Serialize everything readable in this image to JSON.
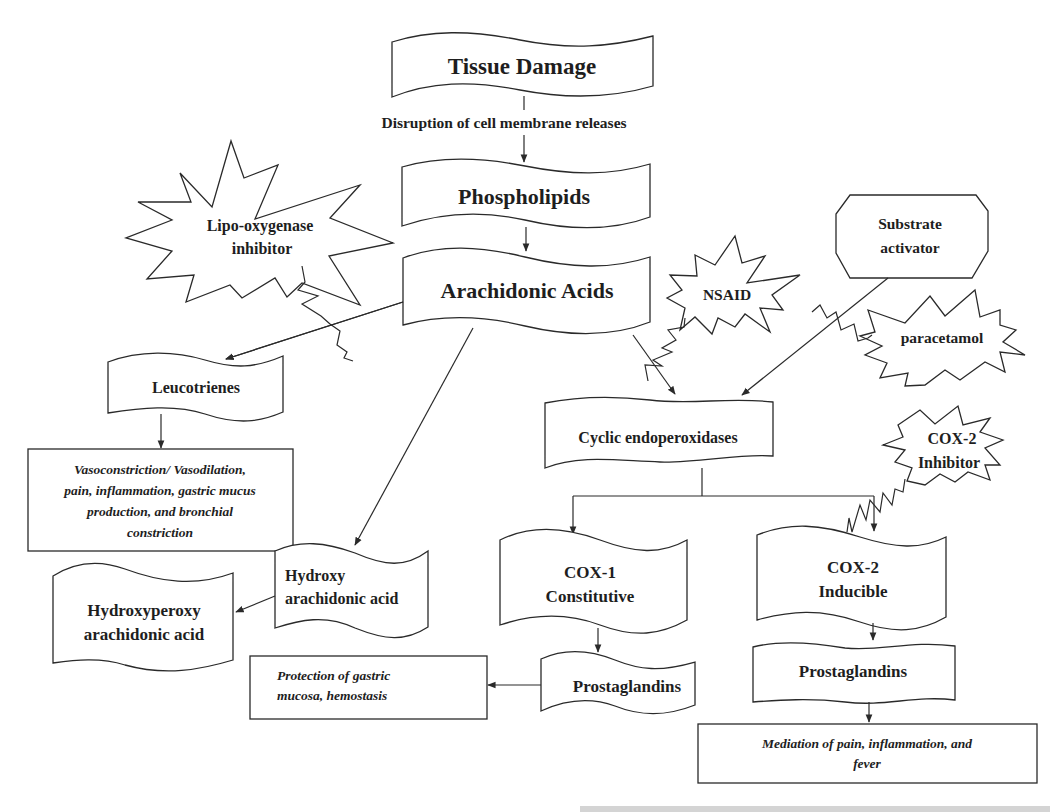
{
  "diagram": {
    "type": "flowchart",
    "topic": "Arachidonic acid pathway and sites of action of inhibitors",
    "nodes": {
      "tissue_damage": {
        "label": "Tissue Damage",
        "shape": "wave-banner"
      },
      "disruption_label": {
        "label": "Disruption of cell membrane releases",
        "shape": "edge-label"
      },
      "phospholipids": {
        "label": "Phospholipids",
        "shape": "wave-banner"
      },
      "arachidonic_acids": {
        "label": "Arachidonic Acids",
        "shape": "wave-banner"
      },
      "lipo_oxygenase_inhibitor": {
        "line1": "Lipo-oxygenase",
        "line2": "inhibitor",
        "shape": "explosion"
      },
      "nsaid": {
        "label": "NSAID",
        "shape": "explosion"
      },
      "substrate_activator": {
        "line1": "Substrate",
        "line2": "activator",
        "shape": "octagon"
      },
      "paracetamol": {
        "label": "paracetamol",
        "shape": "explosion"
      },
      "cox2_inhibitor": {
        "line1": "COX-2",
        "line2": "Inhibitor",
        "shape": "explosion"
      },
      "leucotrienes": {
        "label": "Leucotrienes",
        "shape": "wave-banner"
      },
      "leucotriene_effects": {
        "line1": "Vasoconstriction/ Vasodilation,",
        "line2": "pain, inflammation, gastric mucus",
        "line3": "production, and bronchial",
        "line4": "constriction",
        "shape": "rectangle"
      },
      "cyclic_endoperoxidases": {
        "label": "Cyclic endoperoxidases",
        "shape": "wave-banner"
      },
      "hydroxy_arachidonic_acid": {
        "line1": "Hydroxy",
        "line2": "arachidonic acid",
        "shape": "wave-banner"
      },
      "hydroxyperoxy_arachidonic_acid": {
        "line1": "Hydroxyperoxy",
        "line2": "arachidonic acid",
        "shape": "wave-banner"
      },
      "cox1": {
        "line1": "COX-1",
        "line2": "Constitutive",
        "shape": "wave-banner"
      },
      "cox2": {
        "line1": "COX-2",
        "line2": "Inducible",
        "shape": "wave-banner"
      },
      "prostaglandins_cox1": {
        "label": "Prostaglandins",
        "shape": "wave-banner"
      },
      "prostaglandins_cox2": {
        "label": "Prostaglandins",
        "shape": "wave-banner"
      },
      "cox1_effects": {
        "line1": "Protection of gastric",
        "line2": "mucosa, hemostasis",
        "shape": "rectangle"
      },
      "cox2_effects": {
        "line1": "Mediation of pain, inflammation, and",
        "line2": "fever",
        "shape": "rectangle"
      }
    },
    "edges": [
      {
        "from": "tissue_damage",
        "to": "phospholipids",
        "label": "Disruption of cell membrane releases"
      },
      {
        "from": "phospholipids",
        "to": "arachidonic_acids"
      },
      {
        "from": "arachidonic_acids",
        "to": "leucotrienes"
      },
      {
        "from": "arachidonic_acids",
        "to": "hydroxy_arachidonic_acid"
      },
      {
        "from": "arachidonic_acids",
        "to": "cyclic_endoperoxidases"
      },
      {
        "from": "substrate_activator",
        "to": "cyclic_endoperoxidases"
      },
      {
        "from": "leucotrienes",
        "to": "leucotriene_effects"
      },
      {
        "from": "hydroxy_arachidonic_acid",
        "to": "hydroxyperoxy_arachidonic_acid"
      },
      {
        "from": "cyclic_endoperoxidases",
        "to": "cox1"
      },
      {
        "from": "cyclic_endoperoxidases",
        "to": "cox2"
      },
      {
        "from": "cox1",
        "to": "prostaglandins_cox1"
      },
      {
        "from": "cox2",
        "to": "prostaglandins_cox2"
      },
      {
        "from": "prostaglandins_cox1",
        "to": "cox1_effects"
      },
      {
        "from": "prostaglandins_cox2",
        "to": "cox2_effects"
      }
    ],
    "inhibitions": [
      {
        "inhibitor": "lipo_oxygenase_inhibitor",
        "blocks": "arachidonic_acids -> leucotrienes"
      },
      {
        "inhibitor": "nsaid",
        "blocks": "arachidonic_acids -> cyclic_endoperoxidases"
      },
      {
        "inhibitor": "paracetamol",
        "blocks": "substrate_activator -> cyclic_endoperoxidases"
      },
      {
        "inhibitor": "cox2_inhibitor",
        "blocks": "cyclic_endoperoxidases -> cox2"
      }
    ],
    "colors": {
      "stroke": "#2a2a2a",
      "fill": "#ffffff",
      "text": "#1e1e1e",
      "background": "#ffffff"
    }
  }
}
